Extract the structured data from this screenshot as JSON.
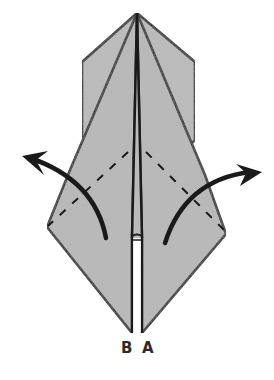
{
  "diagram": {
    "type": "origami-fold-step",
    "paper_color": "#b9b9b9",
    "line_color": "#1a1a1a",
    "arrows": [
      {
        "name": "left-unfold-arrow",
        "direction": "up-left"
      },
      {
        "name": "right-unfold-arrow",
        "direction": "up-right"
      }
    ],
    "labels": {
      "left_point": "B",
      "right_point": "A"
    }
  }
}
